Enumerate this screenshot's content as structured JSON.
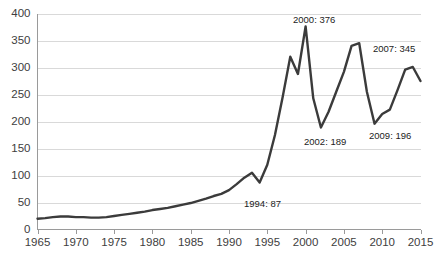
{
  "chart_data": {
    "type": "line",
    "title": "",
    "subtitle": "",
    "xlabel": "",
    "ylabel": "",
    "xlim": [
      1965,
      2015
    ],
    "ylim": [
      0,
      400
    ],
    "grid": true,
    "legend": false,
    "legend_position": "none",
    "line_color": "#3b3b3b",
    "gridline_color": "#d9d9d9",
    "axis_color": "#9a9a9a",
    "text_color": "#404040",
    "y_ticks": [
      0,
      50,
      100,
      150,
      200,
      250,
      300,
      350,
      400
    ],
    "y_tick_labels": [
      "0",
      "50",
      "100",
      "150",
      "200",
      "250",
      "300",
      "350",
      "400"
    ],
    "x_ticks": [
      1965,
      1970,
      1975,
      1980,
      1985,
      1990,
      1995,
      2000,
      2005,
      2010,
      2015
    ],
    "x_tick_labels": [
      "1965",
      "1970",
      "1975",
      "1980",
      "1985",
      "1990",
      "1995",
      "2000",
      "2005",
      "2010",
      "2015"
    ],
    "series": [
      {
        "name": "value",
        "x": [
          1965,
          1966,
          1967,
          1968,
          1969,
          1970,
          1971,
          1972,
          1973,
          1974,
          1975,
          1976,
          1977,
          1978,
          1979,
          1980,
          1981,
          1982,
          1983,
          1984,
          1985,
          1986,
          1987,
          1988,
          1989,
          1990,
          1991,
          1992,
          1993,
          1994,
          1995,
          1996,
          1997,
          1998,
          1999,
          2000,
          2001,
          2002,
          2003,
          2004,
          2005,
          2006,
          2007,
          2008,
          2009,
          2010,
          2011,
          2012,
          2013,
          2014,
          2015
        ],
        "values": [
          20,
          21,
          23,
          24,
          24,
          23,
          23,
          22,
          22,
          23,
          25,
          27,
          29,
          31,
          33,
          36,
          38,
          40,
          43,
          46,
          49,
          53,
          57,
          62,
          66,
          73,
          84,
          96,
          105,
          87,
          120,
          175,
          245,
          320,
          288,
          376,
          243,
          189,
          218,
          255,
          292,
          340,
          345,
          255,
          196,
          214,
          222,
          258,
          296,
          301,
          275
        ]
      }
    ],
    "annotations": [
      {
        "label": "1994: 87",
        "year": 1994,
        "value": 87,
        "x_px": 244,
        "y_px": 204
      },
      {
        "label": "2000: 376",
        "year": 2000,
        "value": 376,
        "x_px": 293,
        "y_px": 20
      },
      {
        "label": "2002: 189",
        "year": 2002,
        "value": 189,
        "x_px": 304,
        "y_px": 142
      },
      {
        "label": "2007: 345",
        "year": 2007,
        "value": 345,
        "x_px": 373,
        "y_px": 49
      },
      {
        "label": "2009: 196",
        "year": 2009,
        "value": 196,
        "x_px": 369,
        "y_px": 136
      }
    ]
  }
}
